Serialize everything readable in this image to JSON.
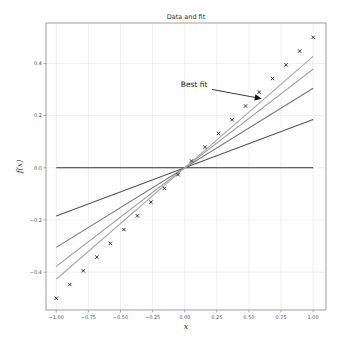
{
  "chart_data": {
    "type": "line",
    "title": "Data and fit",
    "xlabel": "x",
    "ylabel": "f(x)",
    "xlim": [
      -1.08,
      1.1
    ],
    "ylim": [
      -0.545,
      0.555
    ],
    "grid": true,
    "xticks": [
      -1.0,
      -0.75,
      -0.5,
      -0.25,
      0.0,
      0.25,
      0.5,
      0.75,
      1.0
    ],
    "xtick_labels": [
      "−1.00",
      "−0.75",
      "−0.50",
      "−0.25",
      "0.00",
      "0.25",
      "0.50",
      "0.75",
      "1.00"
    ],
    "yticks": [
      -0.4,
      -0.2,
      0.0,
      0.2,
      0.4
    ],
    "ytick_labels": [
      "−0.4",
      "−0.2",
      "0.0",
      "0.2",
      "0.4"
    ],
    "scatter": {
      "name": "data",
      "marker": "x",
      "color": "#222222",
      "x": [
        -1.0,
        -0.8947,
        -0.7895,
        -0.6842,
        -0.5789,
        -0.4737,
        -0.3684,
        -0.2632,
        -0.1579,
        -0.0526,
        0.0526,
        0.1579,
        0.2632,
        0.3684,
        0.4737,
        0.5789,
        0.6842,
        0.7895,
        0.8947,
        1.0
      ],
      "y": [
        -0.5,
        -0.4474,
        -0.3947,
        -0.3421,
        -0.2895,
        -0.2368,
        -0.1842,
        -0.1316,
        -0.0789,
        -0.0263,
        0.0263,
        0.0789,
        0.1316,
        0.1842,
        0.2368,
        0.2895,
        0.3421,
        0.3947,
        0.4474,
        0.5
      ]
    },
    "series": [
      {
        "name": "fit iteration 0",
        "slope": 0.0,
        "x": [
          -1.0,
          1.0
        ],
        "y": [
          0.0,
          0.0
        ],
        "color": "#333333"
      },
      {
        "name": "fit iteration 1",
        "slope": 0.185,
        "x": [
          -1.0,
          1.0
        ],
        "y": [
          -0.185,
          0.185
        ],
        "color": "#555555"
      },
      {
        "name": "fit iteration 2",
        "slope": 0.305,
        "x": [
          -1.0,
          1.0
        ],
        "y": [
          -0.305,
          0.305
        ],
        "color": "#777777"
      },
      {
        "name": "fit iteration 3",
        "slope": 0.378,
        "x": [
          -1.0,
          1.0
        ],
        "y": [
          -0.378,
          0.378
        ],
        "color": "#999999"
      },
      {
        "name": "fit iteration 4",
        "slope": 0.427,
        "x": [
          -1.0,
          1.0
        ],
        "y": [
          -0.427,
          0.427
        ],
        "color": "#aaaaaa"
      }
    ],
    "annotations": [
      {
        "text": "Best fit",
        "text_xy": [
          -0.03,
          0.31
        ],
        "arrow_to": [
          0.6,
          0.265
        ]
      }
    ],
    "legend": "none"
  }
}
